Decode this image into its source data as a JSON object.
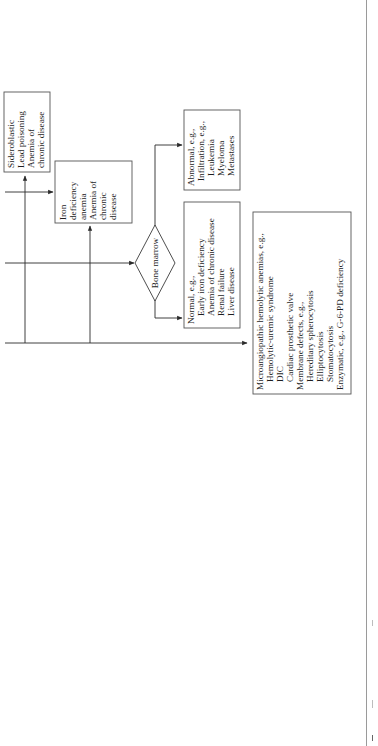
{
  "diagram": {
    "orientation": "rotated 90 degrees clockwise",
    "decision": {
      "label": "Bone marrow"
    },
    "boxes": {
      "sideroblastic": {
        "lines": [
          "Sideroblastic",
          "Lead poisoning",
          "Anemia of",
          "chronic disease"
        ]
      },
      "iron_deficiency": {
        "lines": [
          "Iron",
          "deficiency",
          "anemia",
          "Anemia of",
          "chronic",
          "disease"
        ]
      },
      "abnormal": {
        "lines": [
          "Abnormal, e.g.,",
          "Infiltration, e.g.,",
          "Leukemia",
          "Myeloma",
          "Metastases"
        ]
      },
      "normal": {
        "lines": [
          "Normal, e.g.,",
          "Early iron deficiency",
          "Anemia of chronic disease",
          "Renal failure",
          "Liver disease"
        ]
      },
      "hemolytic": {
        "lines": [
          "Microangiopathic hemolytic anemias, e.g.,",
          "Hemolytic-uremic syndrome",
          "DIC",
          "Cardiac prosthetic valve",
          "Membrane defects, e.g.,",
          "Hereditary spherocytosis",
          "Elliptocytosis",
          "Stomatocytosis",
          "Enzymatic, e.g., G-6-PD deficiency"
        ]
      }
    },
    "colors": {
      "line": "#2a2a2a",
      "box_border": "#555555",
      "background": "#ffffff"
    }
  }
}
